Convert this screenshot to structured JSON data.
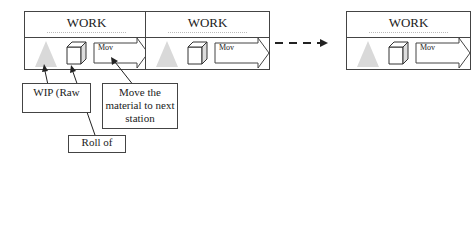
{
  "stations": [
    {
      "title": "WORK",
      "move_text": "Mov"
    },
    {
      "title": "WORK",
      "move_text": "Mov"
    },
    {
      "title": "WORK",
      "move_text": "Mov"
    }
  ],
  "labels": {
    "wip": "WIP (Raw",
    "roll": "Roll of",
    "move": "Move the material to next station"
  }
}
